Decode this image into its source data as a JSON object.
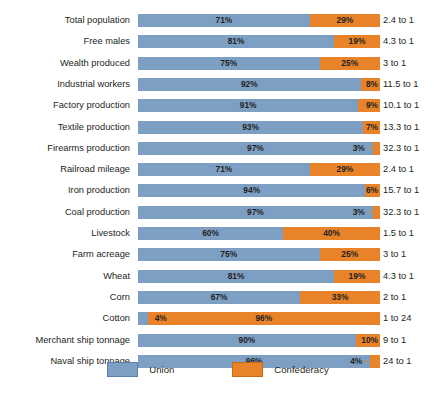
{
  "chart_data": {
    "type": "bar",
    "subtype": "100% stacked horizontal bar",
    "title": "",
    "xlabel": "",
    "ylabel": "",
    "xlim": [
      0,
      100
    ],
    "grid": false,
    "legend_position": "bottom-center",
    "categories": [
      "Total population",
      "Free males",
      "Wealth produced",
      "Industrial workers",
      "Factory production",
      "Textile production",
      "Firearms production",
      "Railroad mileage",
      "Iron production",
      "Coal production",
      "Livestock",
      "Farm acreage",
      "Wheat",
      "Corn",
      "Cotton",
      "Merchant ship tonnage",
      "Naval ship tonnage"
    ],
    "series": [
      {
        "name": "Union",
        "color": "#7d9fc4",
        "values": [
          71,
          81,
          75,
          92,
          91,
          93,
          97,
          71,
          94,
          97,
          60,
          75,
          81,
          67,
          4,
          90,
          96
        ]
      },
      {
        "name": "Confederacy",
        "color": "#e8832a",
        "values": [
          29,
          19,
          25,
          8,
          9,
          7,
          3,
          29,
          6,
          3,
          40,
          25,
          19,
          33,
          96,
          10,
          4
        ]
      }
    ],
    "annotations": [
      "2.4 to 1",
      "4.3 to 1",
      "3 to 1",
      "11.5 to 1",
      "10.1 to 1",
      "13.3 to 1",
      "32.3 to 1",
      "2.4 to 1",
      "15.7 to 1",
      "32.3 to 1",
      "1.5 to 1",
      "3 to 1",
      "4.3 to 1",
      "2 to 1",
      "1 to 24",
      "9 to 1",
      "24 to 1"
    ]
  },
  "rows": [
    {
      "label": "Total population",
      "union": "71%",
      "conf": "29%",
      "ratio": "2.4 to 1"
    },
    {
      "label": "Free males",
      "union": "81%",
      "conf": "19%",
      "ratio": "4.3 to 1"
    },
    {
      "label": "Wealth produced",
      "union": "75%",
      "conf": "25%",
      "ratio": "3 to 1"
    },
    {
      "label": "Industrial workers",
      "union": "92%",
      "conf": "8%",
      "ratio": "11.5 to 1"
    },
    {
      "label": "Factory production",
      "union": "91%",
      "conf": "9%",
      "ratio": "10.1 to 1"
    },
    {
      "label": "Textile production",
      "union": "93%",
      "conf": "7%",
      "ratio": "13.3 to 1"
    },
    {
      "label": "Firearms production",
      "union": "97%",
      "conf": "3%",
      "ratio": "32.3 to 1"
    },
    {
      "label": "Railroad mileage",
      "union": "71%",
      "conf": "29%",
      "ratio": "2.4 to 1"
    },
    {
      "label": "Iron production",
      "union": "94%",
      "conf": "6%",
      "ratio": "15.7 to 1"
    },
    {
      "label": "Coal production",
      "union": "97%",
      "conf": "3%",
      "ratio": "32.3 to 1"
    },
    {
      "label": "Livestock",
      "union": "60%",
      "conf": "40%",
      "ratio": "1.5 to 1"
    },
    {
      "label": "Farm acreage",
      "union": "75%",
      "conf": "25%",
      "ratio": "3 to 1"
    },
    {
      "label": "Wheat",
      "union": "81%",
      "conf": "19%",
      "ratio": "4.3 to 1"
    },
    {
      "label": "Corn",
      "union": "67%",
      "conf": "33%",
      "ratio": "2 to 1"
    },
    {
      "label": "Cotton",
      "union": "4%",
      "conf": "96%",
      "ratio": "1 to 24"
    },
    {
      "label": "Merchant ship tonnage",
      "union": "90%",
      "conf": "10%",
      "ratio": "9 to 1"
    },
    {
      "label": "Naval ship tonnage",
      "union": "96%",
      "conf": "4%",
      "ratio": "24 to 1"
    }
  ],
  "legend": {
    "union_label": "Union",
    "confederacy_label": "Confederacy",
    "union_color": "#7d9fc4",
    "confederacy_color": "#e8832a"
  }
}
